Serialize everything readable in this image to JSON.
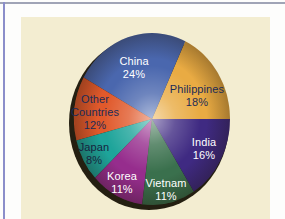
{
  "frame": {
    "page_color": "#fdfdfc",
    "top_line_color": "#a0a4b6",
    "left_line_color": "#8b8eca",
    "panel_color": "#f3edd1"
  },
  "chart_data": {
    "type": "pie",
    "title": "",
    "legend": "none",
    "start_angle_deg_ccw_from_east": 0,
    "direction": "counterclockwise",
    "slices": [
      {
        "label": "Philippines",
        "value_pct": 18,
        "color": "#e9ab43",
        "text_color": "#1b2b57",
        "label_lines": [
          "Philippines",
          "18%"
        ],
        "label_x": 197,
        "label_y": 83
      },
      {
        "label": "China",
        "value_pct": 24,
        "color": "#4a67ae",
        "text_color": "#ffffff",
        "label_lines": [
          "China",
          "24%"
        ],
        "label_x": 134,
        "label_y": 55
      },
      {
        "label": "Other Countries",
        "value_pct": 12,
        "color": "#e0592b",
        "text_color": "#1b2b57",
        "label_lines": [
          "Other",
          "Countries",
          "12%"
        ],
        "label_x": 95,
        "label_y": 93
      },
      {
        "label": "Japan",
        "value_pct": 8,
        "color": "#1ea49a",
        "text_color": "#16243e",
        "label_lines": [
          "Japan",
          "8%"
        ],
        "label_x": 94,
        "label_y": 141
      },
      {
        "label": "Korea",
        "value_pct": 11,
        "color": "#962d8d",
        "text_color": "#ffffff",
        "label_lines": [
          "Korea",
          "11%"
        ],
        "label_x": 122,
        "label_y": 170
      },
      {
        "label": "Vietnam",
        "value_pct": 11,
        "color": "#3a704d",
        "text_color": "#ffffff",
        "label_lines": [
          "Vietnam",
          "11%"
        ],
        "label_x": 166,
        "label_y": 177
      },
      {
        "label": "India",
        "value_pct": 16,
        "color": "#3f2a82",
        "text_color": "#ffffff",
        "label_lines": [
          "India",
          "16%"
        ],
        "label_x": 204,
        "label_y": 136
      }
    ],
    "geometry": {
      "cx": 152,
      "cy": 119,
      "rx": 78,
      "ry": 86,
      "shadow_cx": 149,
      "shadow_cy": 123,
      "shadow_rx": 80,
      "shadow_ry": 87,
      "shadow_color": "#241f11"
    }
  }
}
